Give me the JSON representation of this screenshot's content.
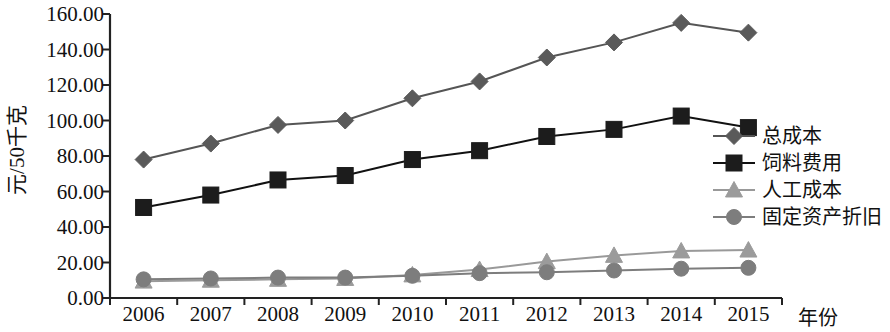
{
  "chart_data": {
    "type": "line",
    "title": "",
    "xlabel": "年份",
    "ylabel": "元/50千克",
    "categories": [
      "2006",
      "2007",
      "2008",
      "2009",
      "2010",
      "2011",
      "2012",
      "2013",
      "2014",
      "2015"
    ],
    "ylim": [
      0,
      160
    ],
    "ytick_step": 20,
    "ytick_labels": [
      "0.00",
      "20.00",
      "40.00",
      "60.00",
      "80.00",
      "100.00",
      "120.00",
      "140.00",
      "160.00"
    ],
    "grid": false,
    "legend_position": "right",
    "series": [
      {
        "name": "总成本",
        "marker": "diamond",
        "color": "#5a5a5a",
        "line_color": "#555555",
        "values": [
          78.0,
          87.0,
          97.5,
          100.0,
          112.5,
          122.0,
          135.5,
          144.0,
          155.0,
          149.5
        ]
      },
      {
        "name": "饲料费用",
        "marker": "square",
        "color": "#1c1c1c",
        "line_color": "#111111",
        "values": [
          51.0,
          58.0,
          66.5,
          69.0,
          78.0,
          83.0,
          91.0,
          95.0,
          102.5,
          96.0
        ]
      },
      {
        "name": "人工成本",
        "marker": "triangle",
        "color": "#9b9b9b",
        "line_color": "#999999",
        "values": [
          9.5,
          10.0,
          10.5,
          11.0,
          13.0,
          16.0,
          20.5,
          24.0,
          26.5,
          27.0
        ]
      },
      {
        "name": "固定资产折旧",
        "marker": "circle",
        "color": "#7d7d7d",
        "line_color": "#7d7d7d",
        "values": [
          10.5,
          11.0,
          11.5,
          11.5,
          12.5,
          14.0,
          14.5,
          15.5,
          16.5,
          17.0
        ]
      }
    ]
  },
  "axis": {
    "x_title": "年份",
    "y_title": "元/50千克"
  },
  "colors": {
    "axis": "#222222",
    "text": "#111111",
    "background": "#ffffff"
  }
}
